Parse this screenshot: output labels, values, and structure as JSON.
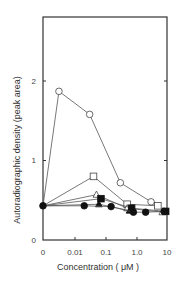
{
  "chart_data": {
    "type": "line",
    "title": "",
    "xlabel": "Concentration ( μM )",
    "ylabel": "Autoradiographic density (peak area)",
    "x_scale": "log (with 0 at origin)",
    "x_ticks": [
      "0",
      "0.01",
      "0.1",
      "1.0",
      "10"
    ],
    "y_ticks": [
      "0",
      "1",
      "2"
    ],
    "ylim": [
      0,
      3.0
    ],
    "grid": false,
    "legend": "none",
    "series": [
      {
        "name": "open-circle",
        "marker": "circle",
        "filled": false,
        "x": [
          0,
          0.003,
          0.03,
          0.3,
          3.0
        ],
        "y": [
          0.43,
          1.87,
          1.58,
          0.72,
          0.48
        ]
      },
      {
        "name": "open-square",
        "marker": "square",
        "filled": false,
        "x": [
          0,
          0.04,
          0.5,
          5.0
        ],
        "y": [
          0.43,
          0.8,
          0.45,
          0.43
        ]
      },
      {
        "name": "open-triangle",
        "marker": "triangle",
        "filled": false,
        "x": [
          0,
          0.05,
          0.5,
          7.0
        ],
        "y": [
          0.43,
          0.57,
          0.4,
          0.35
        ]
      },
      {
        "name": "filled-square",
        "marker": "square",
        "filled": true,
        "x": [
          0,
          0.07,
          0.7,
          9.0
        ],
        "y": [
          0.43,
          0.52,
          0.4,
          0.36
        ]
      },
      {
        "name": "filled-triangle",
        "marker": "triangle",
        "filled": true,
        "x": [
          0,
          0.06,
          0.6
        ],
        "y": [
          0.43,
          0.45,
          0.37
        ]
      },
      {
        "name": "filled-circle",
        "marker": "circle",
        "filled": true,
        "x": [
          0,
          0.02,
          0.15,
          0.8,
          2.0,
          8.0
        ],
        "y": [
          0.43,
          0.43,
          0.42,
          0.35,
          0.35,
          0.36
        ]
      }
    ]
  },
  "labels": {
    "xlabel": "Concentration ( μM )",
    "ylabel": "Autoradiographic density (peak area)",
    "x_ticks": [
      "0",
      "0.01",
      "0.1",
      "1.0",
      "10"
    ],
    "y_ticks": [
      "0",
      "1",
      "2"
    ]
  },
  "colors": {
    "axis": "#333333",
    "line": "#555555",
    "marker_fill": "#111111"
  }
}
